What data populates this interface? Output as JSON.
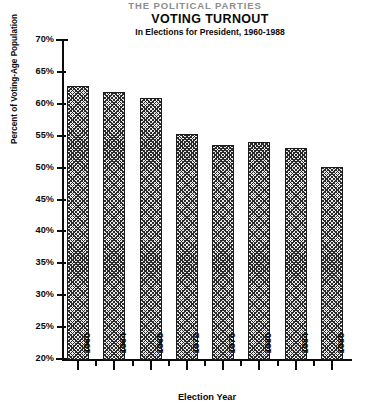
{
  "page": {
    "cut_off_header": "THE POLITICAL PARTIES",
    "background_color": "#ffffff",
    "ink_color": "#0a0a0a"
  },
  "chart_data": {
    "type": "bar",
    "title": "VOTING TURNOUT",
    "subtitle": "In Elections for President, 1960-1988",
    "xlabel": "Election Year",
    "ylabel": "Percent of Voting-Age Population",
    "categories": [
      "1960",
      "1964",
      "1968",
      "1972",
      "1976",
      "1980",
      "1984",
      "1988"
    ],
    "values": [
      62.8,
      61.9,
      60.9,
      55.2,
      53.5,
      54.0,
      53.1,
      50.1
    ],
    "value_labels": [
      "62.8%",
      "61.9%",
      "60.9%",
      "55.2%",
      "53.5%",
      "54.0%",
      "53.1%",
      "50.1%"
    ],
    "ylim": [
      20,
      70
    ],
    "ytick_values": [
      70,
      65,
      60,
      55,
      50,
      45,
      40,
      35,
      30,
      25,
      20
    ],
    "ytick_labels": [
      "70%",
      "65%",
      "60%",
      "55%",
      "50%",
      "45%",
      "40%",
      "35%",
      "30%",
      "25%",
      "20%"
    ],
    "grid": false,
    "legend": null,
    "bar_fill": "crosshatch-pattern",
    "bar_edge_color": "#1a1a1a"
  }
}
